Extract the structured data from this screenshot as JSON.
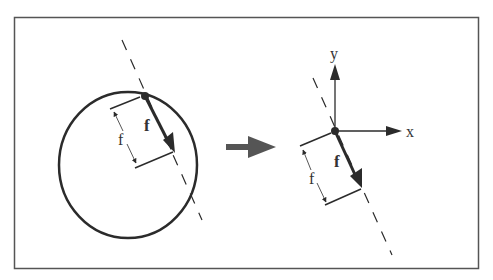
{
  "figure": {
    "colors": {
      "stroke": "#2b2b2b",
      "arrow": "#555555",
      "frame": "#555555",
      "background": "#ffffff"
    },
    "left_panel": {
      "vector_label": "f",
      "dimension_label": "f"
    },
    "transform_arrow": {
      "direction": "right"
    },
    "right_panel": {
      "axis_x_label": "x",
      "axis_y_label": "y",
      "vector_label": "f",
      "dimension_label": "f"
    }
  }
}
